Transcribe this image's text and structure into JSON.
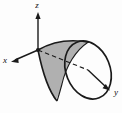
{
  "figure": {
    "background_color": "#fdfdfd",
    "stroke_color": "#1a1a1a",
    "shade_color": "#b0b0b0",
    "axes": [
      {
        "key": "z",
        "label": "z",
        "direction": "up",
        "label_x": 37,
        "label_y": 8
      },
      {
        "key": "x",
        "label": "x",
        "direction": "down-left",
        "label_x": 5,
        "label_y": 63
      },
      {
        "key": "y",
        "label": "y",
        "direction": "down-right",
        "label_x": 114,
        "label_y": 95
      }
    ],
    "origin": {
      "x": 38,
      "y": 50
    },
    "solid": {
      "name": "cone",
      "opening_direction": "+y",
      "apex": {
        "x": 38,
        "y": 50
      },
      "rim_center": {
        "x": 88,
        "y": 70
      },
      "rim_rx": 22,
      "rim_ry": 30,
      "rim_rotation_deg": -22
    },
    "shaded_region": {
      "name": "visible-cone-surface",
      "fill": "#b0b0b0"
    },
    "hidden_edge": {
      "name": "hidden-axis-segment",
      "style": "dashed"
    }
  }
}
